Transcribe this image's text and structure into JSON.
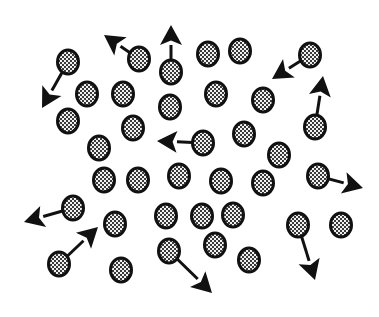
{
  "diagram": {
    "canvas": {
      "width": 379,
      "height": 317,
      "background": "#ffffff"
    },
    "style": {
      "particle_border": "#111111",
      "particle_fill_dark": "#3a3a3a",
      "particle_fill_light": "#f2f2f2",
      "arrow_color": "#111111",
      "particle_rx": 10.5,
      "particle_ry": 12
    },
    "particles": [
      {
        "id": 1,
        "x": 68,
        "y": 62,
        "arrow": {
          "x": 42,
          "y": 108
        }
      },
      {
        "id": 2,
        "x": 139,
        "y": 59,
        "arrow": {
          "x": 104,
          "y": 35
        }
      },
      {
        "id": 3,
        "x": 171,
        "y": 72,
        "arrow": {
          "x": 171,
          "y": 25
        }
      },
      {
        "id": 4,
        "x": 208,
        "y": 54
      },
      {
        "id": 5,
        "x": 240,
        "y": 51
      },
      {
        "id": 6,
        "x": 310,
        "y": 55,
        "arrow": {
          "x": 272,
          "y": 79
        }
      },
      {
        "id": 7,
        "x": 87,
        "y": 94
      },
      {
        "id": 8,
        "x": 123,
        "y": 94
      },
      {
        "id": 9,
        "x": 170,
        "y": 107
      },
      {
        "id": 10,
        "x": 216,
        "y": 94
      },
      {
        "id": 11,
        "x": 263,
        "y": 100
      },
      {
        "id": 12,
        "x": 315,
        "y": 127,
        "arrow": {
          "x": 323,
          "y": 76
        }
      },
      {
        "id": 13,
        "x": 68,
        "y": 121
      },
      {
        "id": 14,
        "x": 133,
        "y": 128
      },
      {
        "id": 15,
        "x": 99,
        "y": 148
      },
      {
        "id": 16,
        "x": 203,
        "y": 143,
        "arrow": {
          "x": 157,
          "y": 141
        }
      },
      {
        "id": 17,
        "x": 244,
        "y": 134
      },
      {
        "id": 18,
        "x": 279,
        "y": 155
      },
      {
        "id": 19,
        "x": 104,
        "y": 180
      },
      {
        "id": 20,
        "x": 138,
        "y": 180
      },
      {
        "id": 21,
        "x": 179,
        "y": 176
      },
      {
        "id": 22,
        "x": 221,
        "y": 181
      },
      {
        "id": 23,
        "x": 263,
        "y": 183
      },
      {
        "id": 24,
        "x": 318,
        "y": 176,
        "arrow": {
          "x": 363,
          "y": 188
        }
      },
      {
        "id": 25,
        "x": 73,
        "y": 208,
        "arrow": {
          "x": 24,
          "y": 222
        }
      },
      {
        "id": 26,
        "x": 115,
        "y": 224
      },
      {
        "id": 27,
        "x": 166,
        "y": 216
      },
      {
        "id": 28,
        "x": 202,
        "y": 216
      },
      {
        "id": 29,
        "x": 233,
        "y": 215
      },
      {
        "id": 30,
        "x": 298,
        "y": 225,
        "arrow": {
          "x": 315,
          "y": 280
        }
      },
      {
        "id": 31,
        "x": 341,
        "y": 225
      },
      {
        "id": 32,
        "x": 59,
        "y": 264,
        "arrow": {
          "x": 98,
          "y": 227
        }
      },
      {
        "id": 33,
        "x": 121,
        "y": 270
      },
      {
        "id": 34,
        "x": 169,
        "y": 251,
        "arrow": {
          "x": 212,
          "y": 293
        }
      },
      {
        "id": 35,
        "x": 215,
        "y": 245
      },
      {
        "id": 36,
        "x": 249,
        "y": 260
      }
    ]
  }
}
